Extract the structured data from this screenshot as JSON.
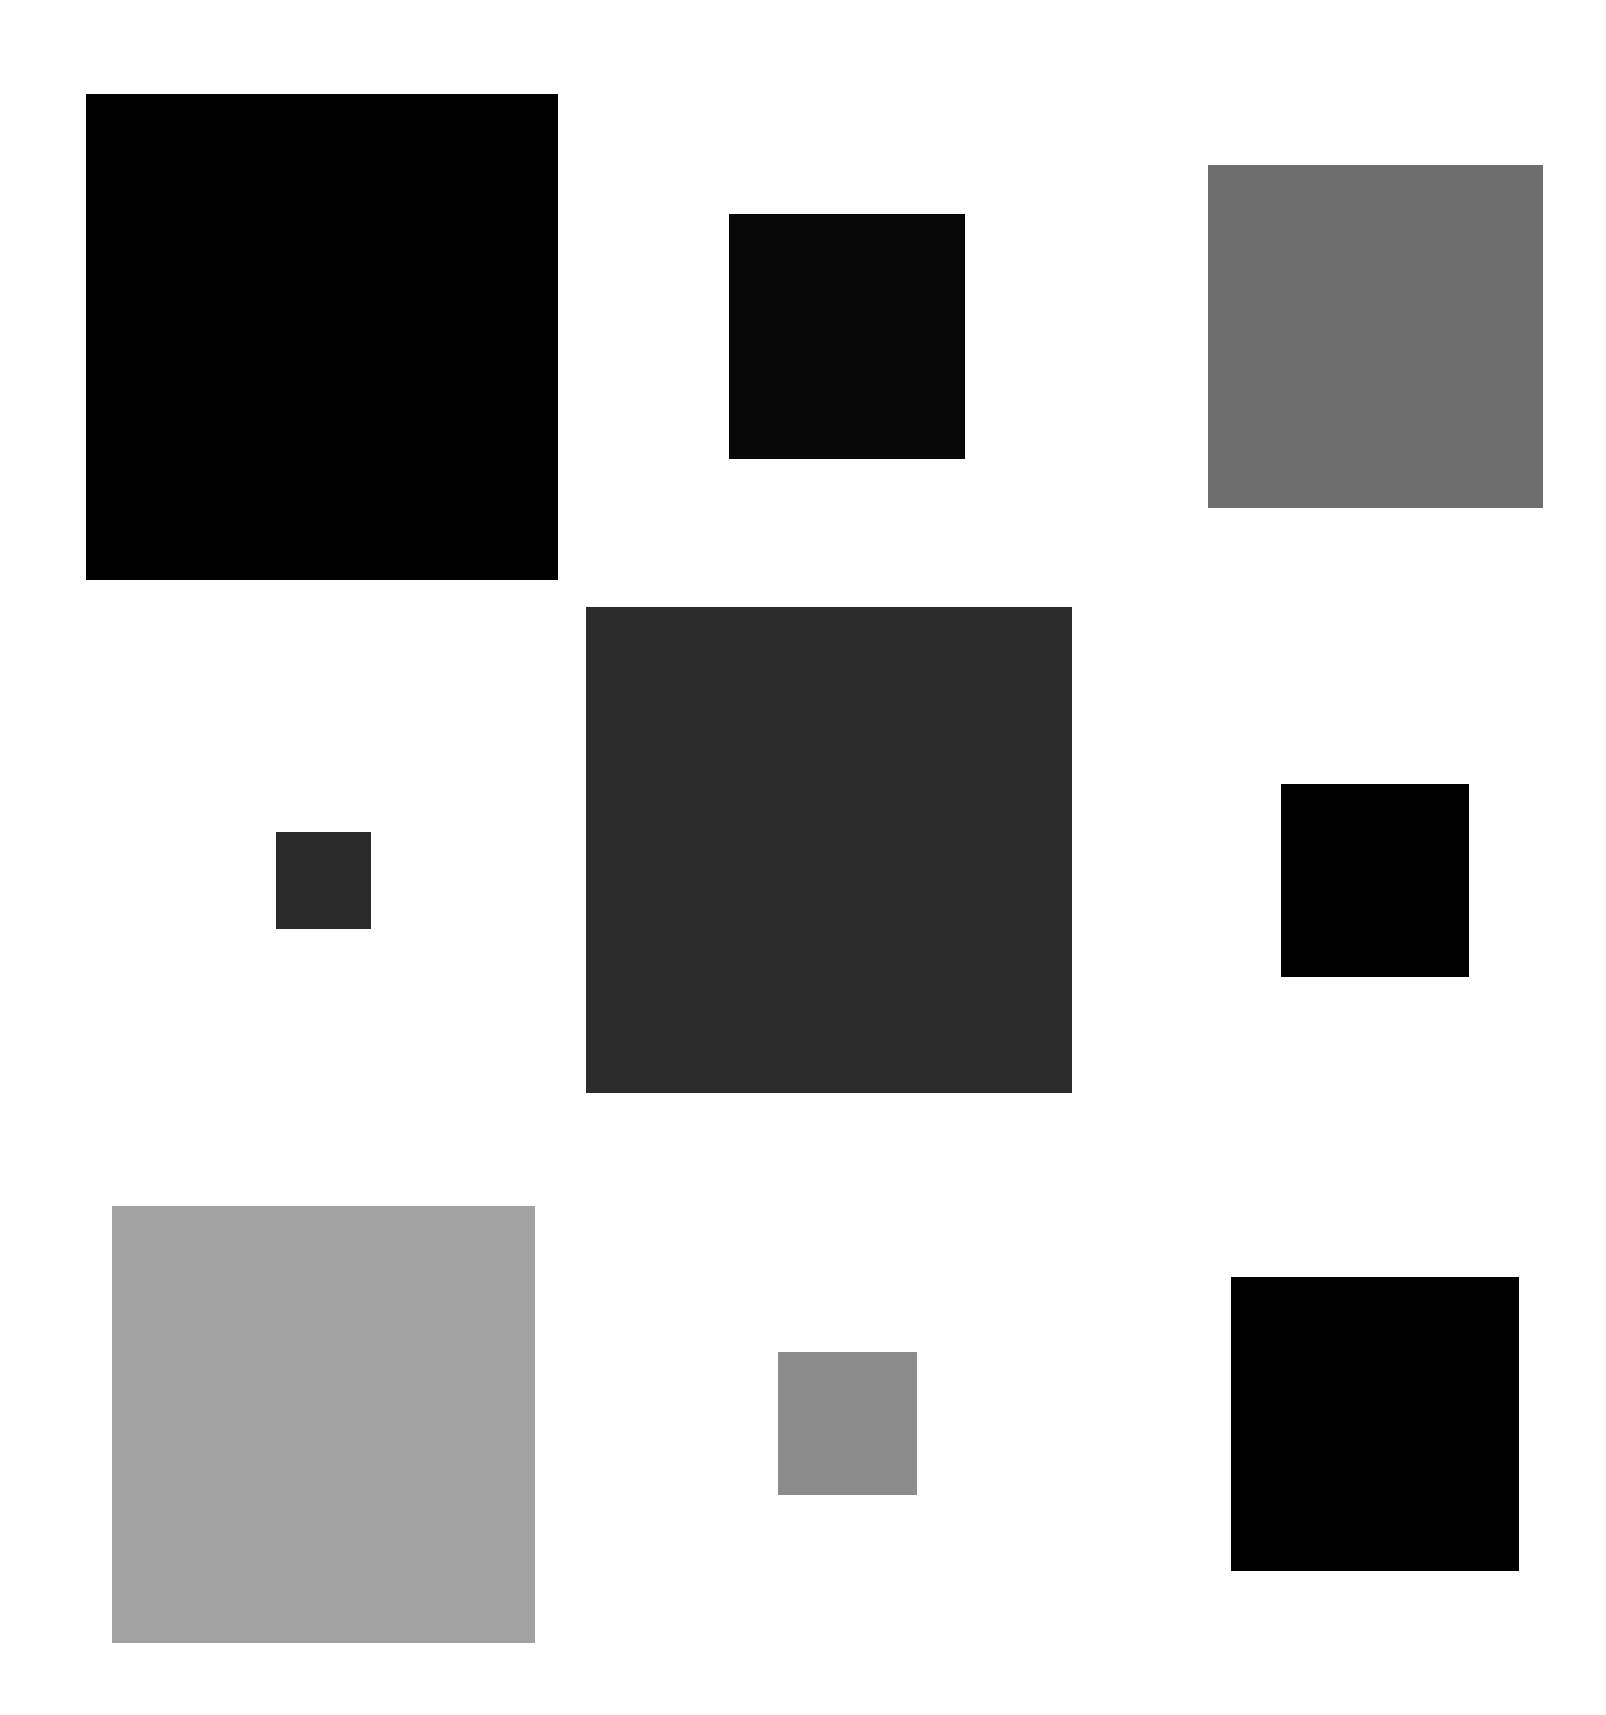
{
  "canvas": {
    "width": 1606,
    "height": 1715,
    "background": "#ffffff"
  },
  "squares": [
    {
      "id": "top-left",
      "x": 86,
      "y": 94,
      "w": 472,
      "h": 486,
      "color": "#000000"
    },
    {
      "id": "top-middle",
      "x": 729,
      "y": 214,
      "w": 236,
      "h": 245,
      "color": "#080808"
    },
    {
      "id": "top-right",
      "x": 1208,
      "y": 165,
      "w": 335,
      "h": 343,
      "color": "#6e6e6e"
    },
    {
      "id": "middle-left",
      "x": 276,
      "y": 832,
      "w": 95,
      "h": 97,
      "color": "#2a2a2a"
    },
    {
      "id": "center",
      "x": 586,
      "y": 607,
      "w": 486,
      "h": 486,
      "color": "#2c2c2c"
    },
    {
      "id": "middle-right",
      "x": 1281,
      "y": 784,
      "w": 188,
      "h": 193,
      "color": "#000000"
    },
    {
      "id": "bottom-left",
      "x": 112,
      "y": 1206,
      "w": 423,
      "h": 437,
      "color": "#a2a2a2"
    },
    {
      "id": "bottom-middle",
      "x": 778,
      "y": 1352,
      "w": 139,
      "h": 143,
      "color": "#8c8c8c"
    },
    {
      "id": "bottom-right",
      "x": 1231,
      "y": 1277,
      "w": 288,
      "h": 294,
      "color": "#000000"
    }
  ]
}
